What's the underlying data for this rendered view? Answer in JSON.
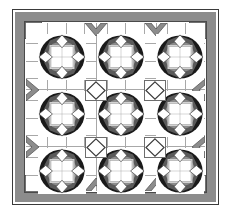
{
  "figure": {
    "name": "quilt-block-layout-diagram",
    "caption": "",
    "background_color": "#ffffff",
    "canvas": {
      "width": 231,
      "height": 224
    }
  },
  "palette": {
    "white": "#ffffff",
    "light_gray": "#d6d6d6",
    "mid_gray": "#8c8c8c",
    "dark_gray": "#5a5a5a",
    "black": "#1a1a1a",
    "seam_line": "#a8a8a8",
    "outline": "#3a3a3a"
  },
  "frame": {
    "outer_outline_label": "quilt-outer-edge",
    "border_band_label": "pieced-outer-border",
    "border_band_color": "#8c8c8c",
    "border_band_width_px": 9,
    "inner_outline_label": "inner-border-seam"
  },
  "layout": {
    "rows": 3,
    "columns": 3,
    "block_count": 9,
    "sashing_count": 12,
    "cornerstone_count": 4,
    "border_corner_triangles": 4,
    "border_chevrons": 8
  },
  "blocks": [
    {
      "id": "block-r1c1",
      "row": 1,
      "column": 1,
      "pattern": "octagon-wheel"
    },
    {
      "id": "block-r1c2",
      "row": 1,
      "column": 2,
      "pattern": "octagon-wheel"
    },
    {
      "id": "block-r1c3",
      "row": 1,
      "column": 3,
      "pattern": "octagon-wheel"
    },
    {
      "id": "block-r2c1",
      "row": 2,
      "column": 1,
      "pattern": "octagon-wheel"
    },
    {
      "id": "block-r2c2",
      "row": 2,
      "column": 2,
      "pattern": "octagon-wheel"
    },
    {
      "id": "block-r2c3",
      "row": 2,
      "column": 3,
      "pattern": "octagon-wheel"
    },
    {
      "id": "block-r3c1",
      "row": 3,
      "column": 1,
      "pattern": "octagon-wheel"
    },
    {
      "id": "block-r3c2",
      "row": 3,
      "column": 2,
      "pattern": "octagon-wheel"
    },
    {
      "id": "block-r3c3",
      "row": 3,
      "column": 3,
      "pattern": "octagon-wheel"
    }
  ],
  "cornerstones": [
    {
      "id": "cornerstone-1",
      "shape": "square-on-point-diamond"
    },
    {
      "id": "cornerstone-2",
      "shape": "square-on-point-diamond"
    },
    {
      "id": "cornerstone-3",
      "shape": "square-on-point-diamond"
    },
    {
      "id": "cornerstone-4",
      "shape": "square-on-point-diamond"
    }
  ]
}
